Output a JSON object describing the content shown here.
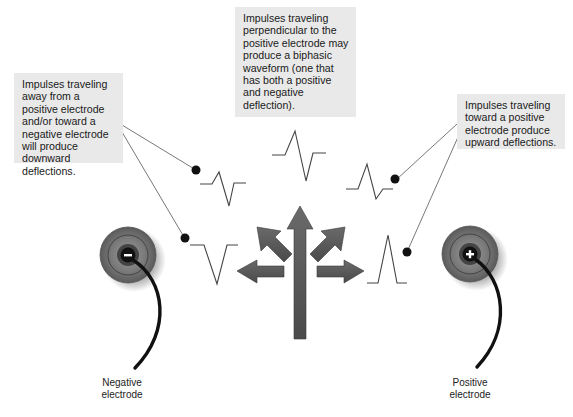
{
  "callouts": {
    "left": "Impulses traveling away from a positive electrode and/or toward a negative electrode will produce downward deflections.",
    "middle": "Impulses traveling perpendicular to the positive electrode may produce a biphasic waveform (one that has both a positive and negative deflection).",
    "right": "Impulses traveling toward a positive electrode produce upward deflections."
  },
  "electrodes": {
    "negative": {
      "symbol": "–",
      "label": "Negative electrode"
    },
    "positive": {
      "symbol": "+",
      "label": "Positive electrode"
    }
  },
  "arrows": [
    "left",
    "up-left",
    "up",
    "up-right",
    "right"
  ],
  "waveforms": [
    "downward-biphasic",
    "downward",
    "biphasic",
    "upward-biphasic",
    "upward"
  ],
  "colors": {
    "callout_bg": "#e9e9e9",
    "arrow": "#555555",
    "electrode_outer": "#6e6e6e",
    "waveform_line": "#444444"
  }
}
